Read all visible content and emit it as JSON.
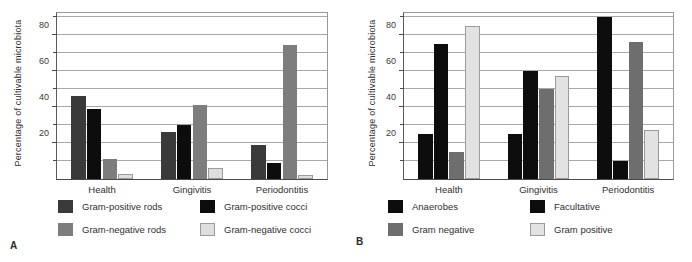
{
  "figure": {
    "background": "#ffffff",
    "panels": [
      {
        "letter": "A",
        "ylabel": "Percentage of cultivable microbiota",
        "categories": [
          "Health",
          "Gingivitis",
          "Periodontitis"
        ],
        "ticks": [
          20,
          40,
          60,
          80
        ],
        "legend": [
          {
            "label": "Gram-positive rods",
            "color": "#3a3a3a"
          },
          {
            "label": "Gram-positive cocci",
            "color": "#0d0d0d"
          },
          {
            "label": "Gram-negative rods",
            "color": "#7d7d7d"
          },
          {
            "label": "Gram-negative cocci",
            "color": "#dedede"
          }
        ]
      },
      {
        "letter": "B",
        "ylabel": "Percentage of cultivable microbiota",
        "categories": [
          "Health",
          "Gingivitis",
          "Periodontitis"
        ],
        "ticks": [
          20,
          40,
          60,
          80
        ],
        "legend": [
          {
            "label": "Anaerobes",
            "color": "#0d0d0d"
          },
          {
            "label": "Facultative",
            "color": "#0d0d0d"
          },
          {
            "label": "Gram negative",
            "color": "#6e6e6e"
          },
          {
            "label": "Gram positive",
            "color": "#e2e2e2"
          }
        ]
      }
    ]
  },
  "chart_data": [
    {
      "type": "bar",
      "panel": "A",
      "title": "",
      "xlabel": "",
      "ylabel": "Percentage of cultivable microbiota",
      "categories": [
        "Health",
        "Gingivitis",
        "Periodontitis"
      ],
      "ylim": [
        0,
        92
      ],
      "yticks": [
        20,
        40,
        60,
        80
      ],
      "gridlines": [
        10,
        20,
        30,
        40,
        50,
        60,
        70,
        80,
        90
      ],
      "grid": true,
      "legend_position": "below",
      "series": [
        {
          "name": "Gram-positive rods",
          "color": "#3a3a3a",
          "values": [
            46,
            26,
            19
          ]
        },
        {
          "name": "Gram-positive cocci",
          "color": "#0d0d0d",
          "values": [
            39,
            30,
            9
          ]
        },
        {
          "name": "Gram-negative rods",
          "color": "#7d7d7d",
          "values": [
            11,
            41,
            74
          ]
        },
        {
          "name": "Gram-negative cocci",
          "color": "#dedede",
          "values": [
            3,
            6,
            2.5
          ]
        }
      ]
    },
    {
      "type": "bar",
      "panel": "B",
      "title": "",
      "xlabel": "",
      "ylabel": "Percentage of cultivable microbiota",
      "categories": [
        "Health",
        "Gingivitis",
        "Periodontitis"
      ],
      "ylim": [
        0,
        92
      ],
      "yticks": [
        20,
        40,
        60,
        80
      ],
      "gridlines": [
        10,
        20,
        30,
        40,
        50,
        60,
        70,
        80,
        90
      ],
      "grid": true,
      "legend_position": "below",
      "series": [
        {
          "name": "Anaerobes",
          "color": "#0d0d0d",
          "values": [
            25,
            25,
            90
          ]
        },
        {
          "name": "Facultative",
          "color": "#0d0d0d",
          "values": [
            75,
            60,
            10
          ]
        },
        {
          "name": "Gram negative",
          "color": "#6e6e6e",
          "values": [
            15,
            50,
            76
          ]
        },
        {
          "name": "Gram positive",
          "color": "#e2e2e2",
          "values": [
            85,
            57,
            27
          ]
        }
      ]
    }
  ]
}
